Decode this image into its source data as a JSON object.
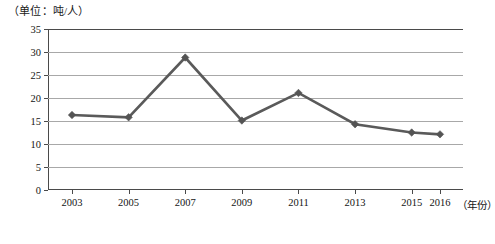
{
  "unit_caption": "（单位：吨/人）",
  "axis": {
    "x_title": "（年份）",
    "y_ticks": [
      "0",
      "5",
      "10",
      "15",
      "20",
      "25",
      "30",
      "35"
    ],
    "x_ticks": [
      "2003",
      "2005",
      "2007",
      "2009",
      "2011",
      "2013",
      "2015",
      "2016"
    ]
  },
  "colors": {
    "line": "#5a5a5a",
    "marker": "#545454",
    "gridline": "#a8a8a8",
    "axis": "#4a4a4a",
    "background": "#ffffff"
  },
  "chart_data": {
    "type": "line",
    "title": "",
    "subtitle": "",
    "xlabel": "（年份）",
    "ylabel": "（单位：吨/人）",
    "categories": [
      "2003",
      "2005",
      "2007",
      "2009",
      "2011",
      "2013",
      "2015",
      "2016"
    ],
    "x": [
      2003,
      2005,
      2007,
      2009,
      2011,
      2013,
      2015,
      2016
    ],
    "values": [
      16.3,
      15.8,
      28.8,
      15.1,
      21.1,
      14.3,
      12.5,
      12.1
    ],
    "series": [
      {
        "name": "",
        "values": [
          16.3,
          15.8,
          28.8,
          15.1,
          21.1,
          14.3,
          12.5,
          12.1
        ]
      }
    ],
    "ylim": [
      0,
      35
    ],
    "ytick_step": 5,
    "xlim": [
      2003,
      2016
    ],
    "grid": true,
    "grid_axis": "y",
    "legend": false,
    "legend_position": "none",
    "marker": "diamond",
    "annotations": []
  }
}
